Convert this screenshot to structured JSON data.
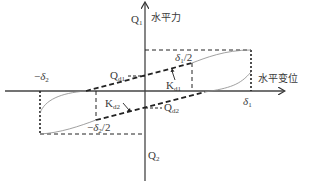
{
  "diagram": {
    "type": "hysteresis-loop-bilinear-model",
    "axes": {
      "y_label": "水平力",
      "x_label": "水平变位"
    },
    "labels": {
      "q1": {
        "main": "Q",
        "sub": "1"
      },
      "q2": {
        "main": "Q",
        "sub": "2"
      },
      "qd1": {
        "main": "Q",
        "sub": "d1"
      },
      "qd2": {
        "main": "Q",
        "sub": "d2"
      },
      "kd1": {
        "main": "K",
        "sub": "d1"
      },
      "kd2": {
        "main": "K",
        "sub": "d2"
      },
      "delta1": {
        "main": "δ",
        "sub": "1"
      },
      "neg_delta2": {
        "prefix": "−",
        "main": "δ",
        "sub": "2"
      },
      "delta1_half": {
        "main": "δ",
        "sub": "1",
        "suffix": "/2"
      },
      "neg_delta2_half": {
        "prefix": "−",
        "main": "δ",
        "sub": "2",
        "suffix": "/2"
      }
    },
    "colors": {
      "axis": "#444444",
      "dashed": "#222222",
      "curve": "#888888"
    }
  }
}
